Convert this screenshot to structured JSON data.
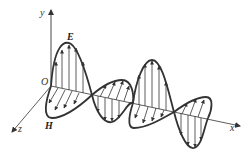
{
  "diagram": {
    "axes": {
      "x_label": "x",
      "y_label": "y",
      "z_label": "z",
      "origin_label": "O"
    },
    "fields": {
      "electric_label": "E",
      "magnetic_label": "H"
    },
    "colors": {
      "line": "#333333",
      "background": "#ffffff"
    }
  }
}
